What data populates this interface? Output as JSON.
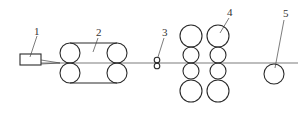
{
  "diagram": {
    "type": "process-line-schematic",
    "labels": {
      "l1": "1",
      "l2": "2",
      "l3": "3",
      "l4": "4",
      "l5": "5"
    },
    "components": [
      {
        "id": "1",
        "shape": "rectangle"
      },
      {
        "id": "2",
        "shape": "belt-roller-pair"
      },
      {
        "id": "3",
        "shape": "small-double-roller"
      },
      {
        "id": "4",
        "shape": "roller-stack-columns"
      },
      {
        "id": "5",
        "shape": "single-roller"
      }
    ],
    "colors": {
      "line": "#2a2a2a",
      "background": "#ffffff"
    }
  }
}
